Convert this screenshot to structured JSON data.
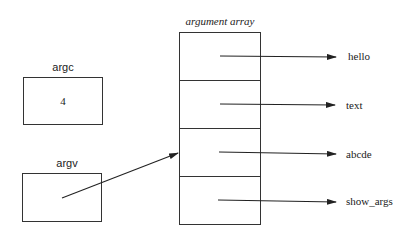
{
  "diagram": {
    "title": "argument array",
    "argc": {
      "label": "argc",
      "value": "4"
    },
    "argv": {
      "label": "argv"
    },
    "array_entries": [
      {
        "target": "hello"
      },
      {
        "target": "text"
      },
      {
        "target": "abcde"
      },
      {
        "target": "show_args"
      }
    ],
    "colors": {
      "stroke": "#333333",
      "text": "#222222",
      "background": "#ffffff"
    }
  }
}
